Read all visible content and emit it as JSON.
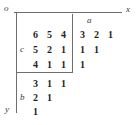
{
  "figure": {
    "axes": {
      "origin_label": "o",
      "x_label": "x",
      "y_label": "y"
    },
    "block_labels": {
      "a": "a",
      "b": "b",
      "c": "c"
    },
    "blocks": {
      "c_block": {
        "label": "c",
        "rows": [
          [
            "6",
            "5",
            "4"
          ],
          [
            "5",
            "2",
            "1"
          ],
          [
            "4",
            "1",
            "1"
          ]
        ]
      },
      "a_block": {
        "label": "a",
        "rows": [
          [
            "3",
            "2",
            "1"
          ],
          [
            "1",
            "1"
          ],
          [
            "1"
          ]
        ]
      },
      "b_block": {
        "label": "b",
        "rows": [
          [
            "3",
            "1",
            "1"
          ],
          [
            "2",
            "1"
          ],
          [
            "1"
          ]
        ]
      }
    },
    "cells": {
      "c_r0_c0": "6",
      "c_r0_c1": "5",
      "c_r0_c2": "4",
      "c_r1_c0": "5",
      "c_r1_c1": "2",
      "c_r1_c2": "1",
      "c_r2_c0": "4",
      "c_r2_c1": "1",
      "c_r2_c2": "1",
      "a_r0_c0": "3",
      "a_r0_c1": "2",
      "a_r0_c2": "1",
      "a_r1_c0": "1",
      "a_r1_c1": "1",
      "a_r2_c0": "1",
      "b_r0_c0": "3",
      "b_r0_c1": "1",
      "b_r0_c2": "1",
      "b_r1_c0": "2",
      "b_r1_c1": "1",
      "b_r2_c0": "1"
    },
    "colors": {
      "rule": "#6e6e6e",
      "text": "#1f1f1f",
      "label": "#3a3a3a",
      "background": "#ffffff"
    }
  }
}
